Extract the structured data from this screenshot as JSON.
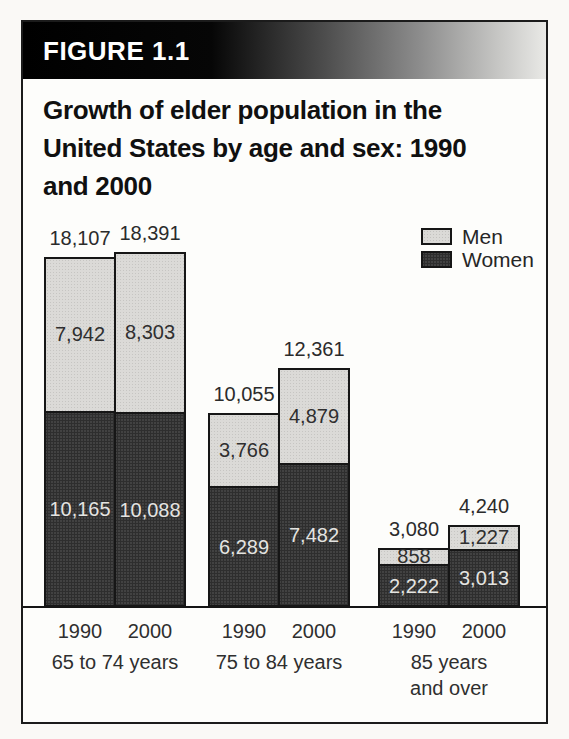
{
  "figure": {
    "header": {
      "label": "FIGURE 1.1",
      "text_color": "#ffffff"
    },
    "title": {
      "text": "Growth of elder population in the United States by age and sex: 1990 and 2000",
      "lines": [
        "Growth of elder population in the",
        "United States by age and sex: 1990",
        "and 2000"
      ]
    },
    "legend": {
      "items": [
        {
          "label": "Men",
          "color": "#dbdad7"
        },
        {
          "label": "Women",
          "color": "#424242"
        }
      ]
    }
  },
  "chart_data": {
    "type": "bar",
    "stacked": true,
    "title": "Growth of elder population in the United States by age and sex: 1990 and 2000",
    "categories": [
      "65 to 74 years",
      "75 to 84 years",
      "85 years and over"
    ],
    "bar_labels_per_category": [
      "1990",
      "2000"
    ],
    "series": [
      {
        "name": "Men",
        "color": "#dbdad7",
        "values": {
          "1990": [
            7942,
            3766,
            858
          ],
          "2000": [
            8303,
            4879,
            1227
          ]
        }
      },
      {
        "name": "Women",
        "color": "#424242",
        "values": {
          "1990": [
            10165,
            6289,
            2222
          ],
          "2000": [
            10088,
            7482,
            3013
          ]
        }
      }
    ],
    "totals": {
      "1990": [
        18107,
        10055,
        3080
      ],
      "2000": [
        18391,
        12361,
        4240
      ]
    },
    "ylim": [
      0,
      18391
    ],
    "grid": false,
    "legend_position": "top-right",
    "groups": [
      {
        "label_lines": [
          "65 to 74 years"
        ],
        "bars": [
          {
            "year": "1990",
            "women": 10165,
            "men": 7942,
            "total": 18107
          },
          {
            "year": "2000",
            "women": 10088,
            "men": 8303,
            "total": 18391
          }
        ]
      },
      {
        "label_lines": [
          "75 to 84 years"
        ],
        "bars": [
          {
            "year": "1990",
            "women": 6289,
            "men": 3766,
            "total": 10055
          },
          {
            "year": "2000",
            "women": 7482,
            "men": 4879,
            "total": 12361
          }
        ]
      },
      {
        "label_lines": [
          "85 years",
          "and over"
        ],
        "bars": [
          {
            "year": "1990",
            "women": 2222,
            "men": 858,
            "total": 3080
          },
          {
            "year": "2000",
            "women": 3013,
            "men": 1227,
            "total": 4240
          }
        ]
      }
    ]
  }
}
